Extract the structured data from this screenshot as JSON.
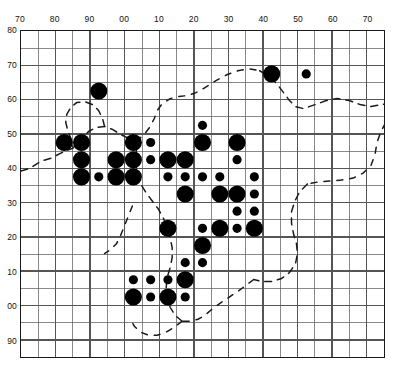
{
  "figure": {
    "kind": "distribution-grid-map",
    "title": "",
    "background_color": "#ffffff",
    "ink_color": "#000000"
  },
  "axes": {
    "top_ticks": [
      "70",
      "80",
      "90",
      "00",
      "10",
      "20",
      "30",
      "40",
      "50",
      "60",
      "70"
    ],
    "left_ticks": [
      "80",
      "70",
      "60",
      "50",
      "40",
      "30",
      "20",
      "10",
      "00",
      "90"
    ],
    "grid_color": "#555555",
    "frame_color": "#1a1a1a",
    "x_range": [
      65,
      170
    ],
    "y_range": [
      -10,
      80
    ],
    "cell_size_units": 5,
    "columns": 21,
    "rows": 19
  },
  "legend": {
    "small_symbol": "small filled circle",
    "large_symbol": "large filled circle",
    "coastline": "dashed outline"
  },
  "chart_data": {
    "type": "scatter",
    "title": "",
    "xlabel": "",
    "ylabel": "",
    "grid": true,
    "legend_position": "none",
    "xlim": [
      0,
      21
    ],
    "ylim": [
      0,
      19
    ],
    "x_tick_labels": [
      "70",
      "80",
      "90",
      "00",
      "10",
      "20",
      "30",
      "40",
      "50",
      "60",
      "70"
    ],
    "y_tick_labels": [
      "80",
      "70",
      "60",
      "50",
      "40",
      "30",
      "20",
      "10",
      "00",
      "90"
    ],
    "x_tick_cols": [
      0,
      2,
      4,
      6,
      8,
      10,
      12,
      14,
      16,
      18,
      20
    ],
    "y_tick_rows": [
      0,
      2,
      4,
      6,
      8,
      10,
      12,
      14,
      16,
      18
    ],
    "series": [
      {
        "name": "records",
        "marker": "filled-circle",
        "color": "#000000",
        "points": [
          {
            "col": 4,
            "row": 3,
            "size": "large"
          },
          {
            "col": 14,
            "row": 2,
            "size": "large"
          },
          {
            "col": 16,
            "row": 2,
            "size": "small"
          },
          {
            "col": 10,
            "row": 5,
            "size": "small"
          },
          {
            "col": 2,
            "row": 6,
            "size": "large"
          },
          {
            "col": 3,
            "row": 6,
            "size": "large"
          },
          {
            "col": 6,
            "row": 6,
            "size": "large"
          },
          {
            "col": 7,
            "row": 6,
            "size": "small"
          },
          {
            "col": 10,
            "row": 6,
            "size": "large"
          },
          {
            "col": 12,
            "row": 6,
            "size": "large"
          },
          {
            "col": 3,
            "row": 7,
            "size": "large"
          },
          {
            "col": 5,
            "row": 7,
            "size": "large"
          },
          {
            "col": 6,
            "row": 7,
            "size": "large"
          },
          {
            "col": 7,
            "row": 7,
            "size": "small"
          },
          {
            "col": 8,
            "row": 7,
            "size": "large"
          },
          {
            "col": 9,
            "row": 7,
            "size": "large"
          },
          {
            "col": 12,
            "row": 7,
            "size": "small"
          },
          {
            "col": 3,
            "row": 8,
            "size": "large"
          },
          {
            "col": 4,
            "row": 8,
            "size": "small"
          },
          {
            "col": 5,
            "row": 8,
            "size": "large"
          },
          {
            "col": 6,
            "row": 8,
            "size": "large"
          },
          {
            "col": 8,
            "row": 8,
            "size": "small"
          },
          {
            "col": 9,
            "row": 8,
            "size": "small"
          },
          {
            "col": 10,
            "row": 8,
            "size": "small"
          },
          {
            "col": 11,
            "row": 8,
            "size": "small"
          },
          {
            "col": 13,
            "row": 8,
            "size": "small"
          },
          {
            "col": 9,
            "row": 9,
            "size": "large"
          },
          {
            "col": 11,
            "row": 9,
            "size": "large"
          },
          {
            "col": 12,
            "row": 9,
            "size": "large"
          },
          {
            "col": 13,
            "row": 9,
            "size": "small"
          },
          {
            "col": 12,
            "row": 10,
            "size": "small"
          },
          {
            "col": 13,
            "row": 10,
            "size": "small"
          },
          {
            "col": 8,
            "row": 11,
            "size": "large"
          },
          {
            "col": 10,
            "row": 11,
            "size": "small"
          },
          {
            "col": 11,
            "row": 11,
            "size": "large"
          },
          {
            "col": 12,
            "row": 11,
            "size": "small"
          },
          {
            "col": 13,
            "row": 11,
            "size": "large"
          },
          {
            "col": 10,
            "row": 12,
            "size": "large"
          },
          {
            "col": 9,
            "row": 13,
            "size": "small"
          },
          {
            "col": 10,
            "row": 13,
            "size": "small"
          },
          {
            "col": 6,
            "row": 14,
            "size": "small"
          },
          {
            "col": 7,
            "row": 14,
            "size": "small"
          },
          {
            "col": 8,
            "row": 14,
            "size": "small"
          },
          {
            "col": 9,
            "row": 14,
            "size": "large"
          },
          {
            "col": 6,
            "row": 15,
            "size": "large"
          },
          {
            "col": 7,
            "row": 15,
            "size": "small"
          },
          {
            "col": 8,
            "row": 15,
            "size": "large"
          },
          {
            "col": 9,
            "row": 15,
            "size": "small"
          }
        ]
      }
    ]
  },
  "coastline": {
    "style": "dashed",
    "color": "#1a1a1a",
    "paths": [
      "M 0 141 L 9 138 L 20 131 L 30 128 L 42 122 L 52 118 L 60 110 L 68 101 L 76 97 L 84 96 L 92 99 L 100 104 L 108 108 L 116 111",
      "M 116 111 L 124 104 L 130 96 L 134 88 L 137 80 L 142 73 L 150 68 L 158 66 L 167 65 L 176 62 L 185 57 L 196 50 L 207 44 L 218 40 L 229 38 L 240 40",
      "M 240 40 L 250 46 L 258 54 L 264 62 L 270 70 L 276 76 L 284 78 L 296 74 L 307 70 L 318 68 L 330 70 L 341 74 L 352 76 L 363 74 L 374 72 L 382 72",
      "M 382 72 L 376 80 L 368 90 L 362 101 L 358 112 L 356 124 L 352 135 L 344 143 L 334 148 L 322 150 L 310 151 L 298 152 L 288 154",
      "M 288 154 L 280 162 L 275 172 L 272 182 L 272 193 L 274 204 L 277 214 L 278 224 L 276 234 L 270 243 L 262 249 L 252 252 L 242 252 L 234 250",
      "M 234 250 L 226 256 L 218 262 L 209 268 L 200 274 L 192 280 L 185 286 L 178 290 L 170 292 L 162 292",
      "M 162 292 L 155 286 L 150 278 L 147 268 L 146 258 L 147 248 L 150 238 L 152 228 L 152 218 L 150 208 L 147 198 L 143 188 L 138 179 L 132 171 L 126 163 L 121 155 L 118 147 L 116 140 L 116 126 L 116 111",
      "M 162 292 L 154 298 L 146 303 L 137 306 L 128 306 L 120 303 L 114 297 L 110 290",
      "M 84 96 L 82 88 L 78 80 L 72 74 L 64 71 L 56 72 L 50 77 L 46 84 L 45 92 L 47 100 L 50 108 L 52 116",
      "M 112 176 L 108 186 L 104 196 L 100 206 L 96 214 L 90 220 L 84 224"
    ]
  }
}
